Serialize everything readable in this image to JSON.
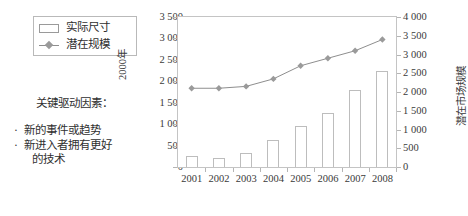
{
  "legend": {
    "items": [
      {
        "label": "实际尺寸",
        "marker": "bar-swatch-icon"
      },
      {
        "label": "潜在规模",
        "marker": "line-diamond-icon"
      }
    ]
  },
  "notes": {
    "title": "关键驱动因素：",
    "bullet": "·",
    "items": [
      "新的事件或趋势",
      "新进入者拥有更好",
      "的技术"
    ]
  },
  "chart_data": {
    "type": "bar",
    "title": "",
    "xlabel": "",
    "ylabel": "2000年",
    "y2label": "潜在市场规模",
    "categories": [
      "2001",
      "2002",
      "2003",
      "2004",
      "2005",
      "2006",
      "2007",
      "2008"
    ],
    "series": [
      {
        "name": "实际尺寸",
        "type": "bar",
        "axis": "left",
        "values": [
          250,
          200,
          330,
          630,
          950,
          1250,
          1800,
          2250
        ]
      },
      {
        "name": "潜在规模",
        "type": "line",
        "axis": "right",
        "values": [
          2100,
          2100,
          2150,
          2350,
          2700,
          2900,
          3100,
          3400
        ]
      }
    ],
    "ylim": [
      0,
      3500
    ],
    "y2lim": [
      0,
      4000
    ],
    "yticks": [
      "0",
      "500",
      "1 000",
      "1 500",
      "2 000",
      "2 500",
      "3 000",
      "3 500"
    ],
    "y2ticks": [
      "0",
      "500",
      "1 000",
      "1 500",
      "2 000",
      "2 500",
      "3 000",
      "3 500",
      "4 000"
    ],
    "ytick_values": [
      0,
      500,
      1000,
      1500,
      2000,
      2500,
      3000,
      3500
    ],
    "y2tick_values": [
      0,
      500,
      1000,
      1500,
      2000,
      2500,
      3000,
      3500,
      4000
    ],
    "grid": false,
    "legend_position": "outside-left"
  },
  "colors": {
    "line": "#8e8e8e",
    "marker": "#9a9a9a",
    "bar_border": "#bdbdbd",
    "axis": "#c4c4c4",
    "text": "#2f2f2f",
    "background": "#ffffff"
  }
}
